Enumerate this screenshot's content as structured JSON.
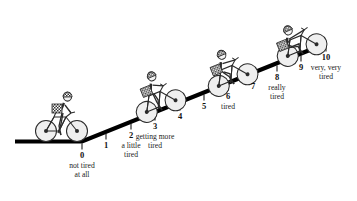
{
  "chart_data": {
    "type": "scale",
    "title": "",
    "xlabel": "",
    "ylabel": "",
    "categories": [
      "0",
      "1",
      "2",
      "3",
      "4",
      "5",
      "6",
      "7",
      "8",
      "9",
      "10"
    ],
    "values": [
      0,
      1,
      2,
      3,
      4,
      5,
      6,
      7,
      8,
      9,
      10
    ],
    "annotations": [
      "not tired\nat all",
      "",
      "a little\ntired",
      "getting more\ntired",
      "",
      "",
      "tired",
      "",
      "really\ntired",
      "",
      "very, very\ntired"
    ],
    "grid": false,
    "legend": "none",
    "axis_range": [
      0,
      10
    ],
    "line_color": "#000000",
    "background_color": "#ffffff"
  },
  "scale": {
    "name": "perceived-exertion-hill-scale",
    "ticks": [
      {
        "number": "0",
        "label": "not tired\nat all",
        "x": 82,
        "y": 141
      },
      {
        "number": "1",
        "label": "",
        "x": 106,
        "y": 131
      },
      {
        "number": "2",
        "label": "a little\ntired",
        "x": 131,
        "y": 121
      },
      {
        "number": "3",
        "label": "getting more\ntired",
        "x": 155,
        "y": 112
      },
      {
        "number": "4",
        "label": "",
        "x": 180,
        "y": 102
      },
      {
        "number": "5",
        "label": "",
        "x": 204,
        "y": 92
      },
      {
        "number": "6",
        "label": "tired",
        "x": 228,
        "y": 82
      },
      {
        "number": "7",
        "label": "",
        "x": 253,
        "y": 72
      },
      {
        "number": "8",
        "label": "really\ntired",
        "x": 277,
        "y": 63
      },
      {
        "number": "9",
        "label": "",
        "x": 301,
        "y": 53
      },
      {
        "number": "10",
        "label": "very, very\ntired",
        "x": 326,
        "y": 43
      }
    ],
    "riders": [
      {
        "name": "cyclist-upright-level",
        "lean": 0,
        "tilt": 0,
        "x": 30,
        "y": 86
      },
      {
        "name": "cyclist-slight-lean",
        "lean": 8,
        "tilt": 22,
        "x": 124,
        "y": 62
      },
      {
        "name": "cyclist-forward-lean",
        "lean": 16,
        "tilt": 22,
        "x": 196,
        "y": 36
      },
      {
        "name": "cyclist-hunched-effort",
        "lean": 26,
        "tilt": 22,
        "x": 265,
        "y": 6
      }
    ]
  }
}
